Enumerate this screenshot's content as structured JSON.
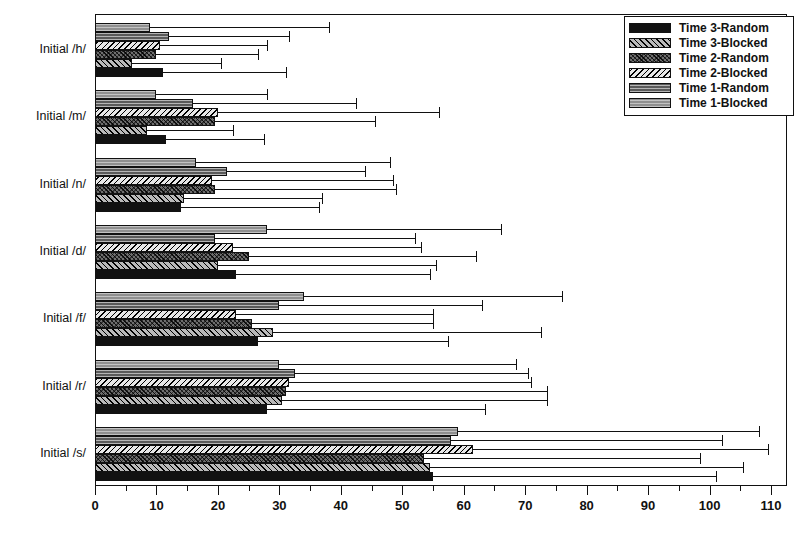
{
  "chart_data": {
    "type": "bar",
    "orientation": "horizontal",
    "title": "",
    "xlabel": "",
    "ylabel": "",
    "xlim": [
      0,
      110
    ],
    "xticks": [
      0,
      10,
      20,
      30,
      40,
      50,
      60,
      70,
      80,
      90,
      100,
      110
    ],
    "xtick_labels": [
      "0",
      "10",
      "20",
      "30",
      "40",
      "50",
      "60",
      "70",
      "80",
      "90",
      "100",
      "110"
    ],
    "minor_tick_step": 5,
    "grid": false,
    "legend_position": "top-right",
    "categories": [
      "Initial /h/",
      "Initial /m/",
      "Initial /n/",
      "Initial /d/",
      "Initial /f/",
      "Initial /r/",
      "Initial /s/"
    ],
    "series": [
      {
        "name": "Time 3-Random",
        "key": "t3r",
        "color": "#111111",
        "pattern": "solid-black",
        "values": [
          11,
          11.5,
          14,
          23,
          26.5,
          28,
          55
        ],
        "errors_upper": [
          31,
          27.5,
          36.5,
          54.5,
          57.5,
          63.5,
          101
        ]
      },
      {
        "name": "Time 3-Blocked",
        "key": "t3b",
        "color": "#b9b9b9",
        "pattern": "diagonal-hatch-light",
        "values": [
          6,
          8.5,
          14.5,
          20,
          29,
          30.5,
          54.5
        ],
        "errors_upper": [
          20.5,
          22.5,
          37,
          55.5,
          72.5,
          73.5,
          105.5
        ]
      },
      {
        "name": "Time 2-Random",
        "key": "t2r",
        "color": "#6e6e6e",
        "pattern": "cross-hatch-dark",
        "values": [
          10,
          19.5,
          19.5,
          25,
          25.5,
          31,
          53.5
        ],
        "errors_upper": [
          26.5,
          45.5,
          49,
          62,
          55,
          73.5,
          98.5
        ]
      },
      {
        "name": "Time 2-Blocked",
        "key": "t2b",
        "color": "#e8e8e8",
        "pattern": "diagonal-hatch-white",
        "values": [
          10.5,
          20,
          19,
          22.5,
          23,
          31.5,
          61.5
        ],
        "errors_upper": [
          28,
          56,
          48.5,
          53,
          55,
          71,
          109.5
        ]
      },
      {
        "name": "Time 1-Random",
        "key": "t1r",
        "color": "#5a5a5a",
        "pattern": "horizontal-line-dark",
        "values": [
          12,
          16,
          21.5,
          19.5,
          30,
          32.5,
          58
        ],
        "errors_upper": [
          31.5,
          42.5,
          44,
          52,
          63,
          70.5,
          102
        ]
      },
      {
        "name": "Time 1-Blocked",
        "key": "t1b",
        "color": "#8f8f8f",
        "pattern": "horizontal-line-mid",
        "values": [
          9,
          10,
          16.5,
          28,
          34,
          30,
          59
        ],
        "errors_upper": [
          38,
          28,
          48,
          66,
          76,
          68.5,
          108
        ]
      }
    ]
  },
  "legend": {
    "entries": [
      {
        "label": "Time 3-Random",
        "key": "t3r"
      },
      {
        "label": "Time 3-Blocked",
        "key": "t3b"
      },
      {
        "label": "Time 2-Random",
        "key": "t2r"
      },
      {
        "label": "Time 2-Blocked",
        "key": "t2b"
      },
      {
        "label": "Time 1-Random",
        "key": "t1r"
      },
      {
        "label": "Time 1-Blocked",
        "key": "t1b"
      }
    ]
  }
}
